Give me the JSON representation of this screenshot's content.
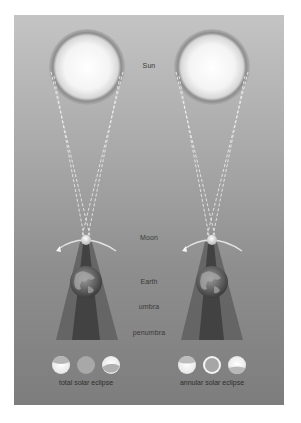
{
  "diagram": {
    "labels": {
      "sun": "Sun",
      "moon": "Moon",
      "earth": "Earth",
      "umbra": "umbra",
      "penumbra": "penumbra"
    },
    "panels": [
      {
        "id": "total",
        "caption": "total solar eclipse",
        "phases": [
          "partial-top",
          "full-cover",
          "partial-bottom"
        ]
      },
      {
        "id": "annular",
        "caption": "annular solar eclipse",
        "phases": [
          "partial-top",
          "ring",
          "partial-bottom"
        ]
      }
    ],
    "colors": {
      "background_top": "#c4c4c4",
      "background_bottom": "#7d7d7d",
      "sun_core": "#ffffff",
      "sun_rim": "#8a8a8a",
      "umbra": "#4a4a4a",
      "penumbra": "#6a6a6a",
      "orbit_arc": "#e0e0e0"
    }
  }
}
